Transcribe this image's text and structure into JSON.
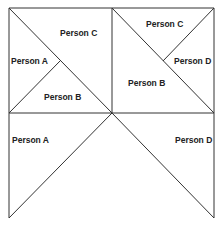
{
  "diagram": {
    "stroke_color": "#333333",
    "labels": {
      "tl_person_c": "Person C",
      "tl_person_a": "Person A",
      "tl_person_b": "Person B",
      "tr_person_c": "Person C",
      "tr_person_d": "Person D",
      "tr_person_b": "Person B",
      "bl_person_a": "Person A",
      "br_person_d": "Person D"
    }
  }
}
